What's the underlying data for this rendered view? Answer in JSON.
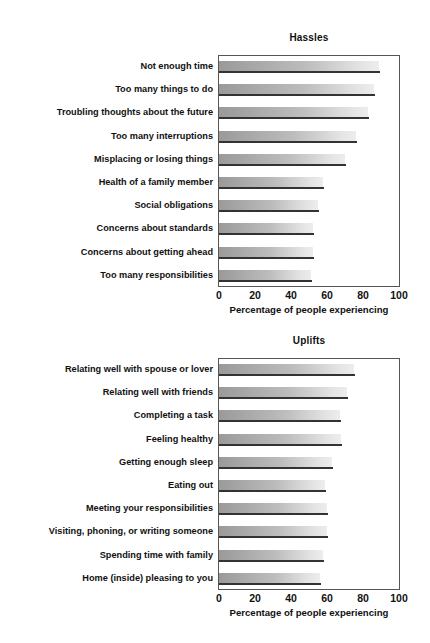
{
  "chart_data": [
    {
      "type": "bar",
      "orientation": "horizontal",
      "title": "Hassles",
      "xlabel": "Percentage of people experiencing",
      "ylabel": "",
      "xlim": [
        0,
        100
      ],
      "xticks": [
        0,
        20,
        40,
        60,
        80,
        100
      ],
      "grid": false,
      "legend": "none",
      "categories": [
        "Not enough time",
        "Too many things to do",
        "Troubling thoughts about the future",
        "Too many interruptions",
        "Misplacing or losing things",
        "Health of a family member",
        "Social obligations",
        "Concerns about standards",
        "Concerns about getting ahead",
        "Too many responsibilities"
      ],
      "values": [
        89,
        86,
        83,
        76,
        70,
        58,
        55,
        52,
        52,
        51
      ]
    },
    {
      "type": "bar",
      "orientation": "horizontal",
      "title": "Uplifts",
      "xlabel": "Percentage of people experiencing",
      "ylabel": "",
      "xlim": [
        0,
        100
      ],
      "xticks": [
        0,
        20,
        40,
        60,
        80,
        100
      ],
      "grid": false,
      "legend": "none",
      "categories": [
        "Relating well with spouse or lover",
        "Relating well with friends",
        "Completing a task",
        "Feeling healthy",
        "Getting enough sleep",
        "Eating out",
        "Meeting your responsibilities",
        "Visiting, phoning, or writing someone",
        "Spending time with family",
        "Home (inside) pleasing to you"
      ],
      "values": [
        75,
        71,
        67,
        68,
        63,
        59,
        60,
        60,
        58,
        56
      ]
    }
  ],
  "colors": {
    "bar_light": "#ededed",
    "bar_dark": "#9a9a9a",
    "bar_edge": "#333333",
    "frame": "#555555",
    "text": "#111111",
    "background": "#ffffff"
  }
}
